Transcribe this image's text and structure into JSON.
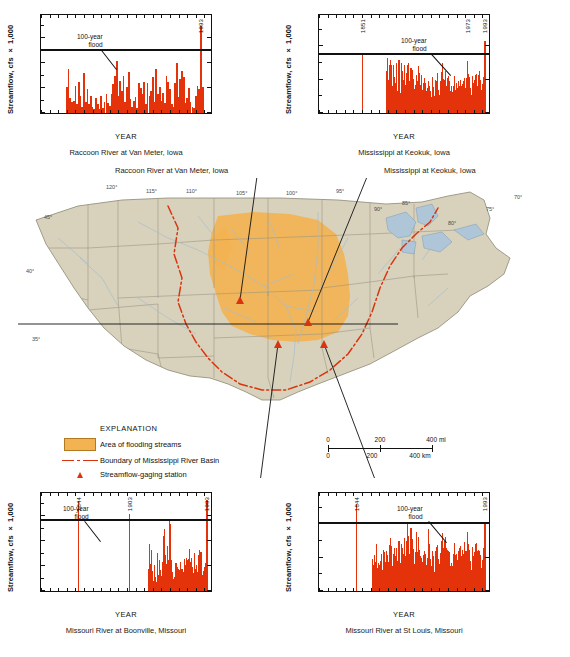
{
  "figure": {
    "red": "#e4320b",
    "flood_orange": "#f3b352",
    "boundary_red": "#d8350f"
  },
  "explanation": {
    "title": "EXPLANATION",
    "items": [
      {
        "key": "area-swatch",
        "label": "Area of flooding streams"
      },
      {
        "key": "boundary-line",
        "label": "Boundary of Mississippi River Basin"
      },
      {
        "key": "station-triangle",
        "label": "Streamflow-gaging station"
      }
    ]
  },
  "scalebar": {
    "miles": [
      "0",
      "200",
      "400 mi"
    ],
    "km": [
      "0",
      "200",
      "400 km"
    ]
  },
  "map": {
    "callouts": [
      {
        "name": "callout-raccoon",
        "text": "Raccoon River at Van Meter, Iowa"
      },
      {
        "name": "callout-keokuk",
        "text": "Mississippi at Keokuk, Iowa"
      }
    ],
    "graticule_labels": [
      "120°",
      "115°",
      "110°",
      "105°",
      "100°",
      "95°",
      "90°",
      "85°",
      "80°",
      "75°",
      "70°",
      "45°",
      "40°",
      "35°"
    ]
  },
  "chart_data": [
    {
      "id": "raccoon",
      "type": "bar",
      "title": "Raccoon River at Van Meter, Iowa",
      "xlabel": "YEAR",
      "ylabel": "Streamflow, cfs × 1,000",
      "xlim": [
        1900,
        2000
      ],
      "ylim": [
        0,
        80
      ],
      "yticks": [
        0,
        20,
        40,
        60,
        80
      ],
      "ytick_labels": [
        "0",
        "20",
        "40",
        "60",
        "80"
      ],
      "xticks": [
        1900,
        1950,
        2000
      ],
      "xtick_labels": [
        "1900",
        "1950",
        "2000"
      ],
      "flood_level": 50,
      "flood_label": "100-year\nflood",
      "annotations": [
        {
          "year": 1993,
          "label": "1993"
        }
      ],
      "x": [
        1915,
        1916,
        1917,
        1918,
        1919,
        1920,
        1921,
        1922,
        1923,
        1924,
        1925,
        1926,
        1927,
        1928,
        1929,
        1930,
        1931,
        1932,
        1933,
        1934,
        1935,
        1936,
        1937,
        1938,
        1939,
        1940,
        1941,
        1942,
        1943,
        1944,
        1945,
        1946,
        1947,
        1948,
        1949,
        1950,
        1951,
        1952,
        1953,
        1954,
        1955,
        1956,
        1957,
        1958,
        1959,
        1960,
        1961,
        1962,
        1963,
        1964,
        1965,
        1966,
        1967,
        1968,
        1969,
        1970,
        1971,
        1972,
        1973,
        1974,
        1975,
        1976,
        1977,
        1978,
        1979,
        1980,
        1981,
        1982,
        1983,
        1984,
        1985,
        1986,
        1987,
        1988,
        1989,
        1990,
        1991,
        1992,
        1993,
        1994
      ],
      "values": [
        21,
        35,
        12,
        9,
        10,
        22,
        7,
        25,
        14,
        5,
        32,
        9,
        19,
        7,
        14,
        5,
        3,
        12,
        7,
        3,
        14,
        4,
        9,
        15,
        8,
        6,
        15,
        23,
        30,
        42,
        14,
        26,
        18,
        30,
        9,
        21,
        33,
        11,
        5,
        10,
        13,
        4,
        24,
        20,
        15,
        25,
        7,
        24,
        14,
        18,
        29,
        9,
        35,
        15,
        21,
        10,
        16,
        8,
        30,
        25,
        19,
        7,
        5,
        24,
        40,
        13,
        27,
        34,
        29,
        8,
        12,
        20,
        9,
        5,
        4,
        14,
        22,
        19,
        70,
        21
      ]
    },
    {
      "id": "keokuk",
      "type": "bar",
      "title": "Mississippi at Keokuk, Iowa",
      "xlabel": "YEAR",
      "ylabel": "Streamflow, cfs × 1,000",
      "xlim": [
        1800,
        2000
      ],
      "ylim": [
        0,
        600
      ],
      "yticks": [
        0,
        200,
        400,
        600
      ],
      "ytick_labels": [
        "0",
        "200",
        "400",
        "600"
      ],
      "xticks": [
        1800,
        1900,
        2000
      ],
      "xtick_labels": [
        "1800",
        "1900",
        "2000"
      ],
      "flood_level": 350,
      "flood_label": "100-year\nflood",
      "annotations": [
        {
          "year": 1851,
          "label": "1851",
          "value": 360
        },
        {
          "year": 1973,
          "label": "1973"
        },
        {
          "year": 1993,
          "label": "1993"
        }
      ],
      "x": [
        1851,
        1878,
        1879,
        1880,
        1881,
        1882,
        1883,
        1884,
        1885,
        1886,
        1887,
        1888,
        1889,
        1890,
        1891,
        1892,
        1893,
        1894,
        1895,
        1896,
        1897,
        1898,
        1899,
        1900,
        1901,
        1902,
        1903,
        1904,
        1905,
        1906,
        1907,
        1908,
        1909,
        1910,
        1911,
        1912,
        1913,
        1914,
        1915,
        1916,
        1917,
        1918,
        1919,
        1920,
        1921,
        1922,
        1923,
        1924,
        1925,
        1926,
        1927,
        1928,
        1929,
        1930,
        1931,
        1932,
        1933,
        1934,
        1935,
        1936,
        1937,
        1938,
        1939,
        1940,
        1941,
        1942,
        1943,
        1944,
        1945,
        1946,
        1947,
        1948,
        1949,
        1950,
        1951,
        1952,
        1953,
        1954,
        1955,
        1956,
        1957,
        1958,
        1959,
        1960,
        1961,
        1962,
        1963,
        1964,
        1965,
        1966,
        1967,
        1968,
        1969,
        1970,
        1971,
        1972,
        1973,
        1974,
        1975,
        1976,
        1977,
        1978,
        1979,
        1980,
        1981,
        1982,
        1983,
        1984,
        1985,
        1986,
        1987,
        1988,
        1989,
        1990,
        1991,
        1992,
        1993,
        1994
      ],
      "values": [
        360,
        150,
        250,
        330,
        200,
        290,
        320,
        290,
        160,
        130,
        290,
        215,
        180,
        300,
        130,
        260,
        320,
        150,
        120,
        300,
        250,
        200,
        290,
        150,
        170,
        240,
        290,
        300,
        190,
        160,
        270,
        160,
        260,
        205,
        145,
        170,
        230,
        140,
        190,
        280,
        240,
        170,
        230,
        140,
        165,
        180,
        210,
        180,
        130,
        150,
        195,
        160,
        145,
        130,
        95,
        215,
        155,
        105,
        200,
        110,
        190,
        240,
        140,
        110,
        190,
        245,
        225,
        300,
        205,
        200,
        250,
        165,
        185,
        210,
        225,
        195,
        130,
        160,
        125,
        130,
        165,
        225,
        140,
        180,
        150,
        190,
        165,
        155,
        200,
        160,
        175,
        190,
        210,
        150,
        165,
        210,
        315,
        235,
        215,
        150,
        110,
        175,
        225,
        180,
        200,
        230,
        235,
        160,
        230,
        225,
        255,
        200,
        140,
        175,
        215,
        260,
        435,
        170
      ]
    },
    {
      "id": "boonville",
      "type": "bar",
      "title": "Missouri River at Boonville, Missouri",
      "xlabel": "YEAR",
      "ylabel": "Streamflow, cfs × 1,000",
      "xlim": [
        1800,
        2000
      ],
      "ylim": [
        0,
        800
      ],
      "yticks": [
        0,
        200,
        400,
        600,
        800
      ],
      "ytick_labels": [
        "0",
        "200",
        "400",
        "600",
        "800"
      ],
      "xticks": [
        1800,
        1900,
        2000
      ],
      "xtick_labels": [
        "1800",
        "1900",
        "2000"
      ],
      "flood_level": 560,
      "flood_label": "100-year\nflood",
      "annotations": [
        {
          "year": 1844,
          "label": "1844",
          "value": 720
        },
        {
          "year": 1903,
          "label": "1903",
          "value": 620
        },
        {
          "year": 1993,
          "label": "1993",
          "value": 725
        }
      ],
      "x": [
        1844,
        1903,
        1925,
        1926,
        1927,
        1928,
        1929,
        1930,
        1931,
        1932,
        1933,
        1934,
        1935,
        1936,
        1937,
        1938,
        1939,
        1940,
        1941,
        1942,
        1943,
        1944,
        1945,
        1946,
        1947,
        1948,
        1949,
        1950,
        1951,
        1952,
        1953,
        1954,
        1955,
        1956,
        1957,
        1958,
        1959,
        1960,
        1961,
        1962,
        1963,
        1964,
        1965,
        1966,
        1967,
        1968,
        1969,
        1970,
        1971,
        1972,
        1973,
        1974,
        1975,
        1976,
        1977,
        1978,
        1979,
        1980,
        1981,
        1982,
        1983,
        1984,
        1985,
        1986,
        1987,
        1988,
        1989,
        1990,
        1991,
        1992,
        1993
      ],
      "values": [
        720,
        620,
        180,
        375,
        220,
        200,
        330,
        160,
        80,
        210,
        110,
        70,
        305,
        105,
        125,
        245,
        170,
        120,
        230,
        345,
        440,
        500,
        285,
        215,
        360,
        250,
        565,
        290,
        535,
        250,
        150,
        100,
        110,
        90,
        225,
        210,
        195,
        175,
        165,
        230,
        175,
        165,
        180,
        150,
        255,
        205,
        265,
        245,
        225,
        260,
        340,
        235,
        265,
        190,
        145,
        235,
        305,
        175,
        205,
        155,
        290,
        330,
        300,
        310,
        250,
        130,
        160,
        195,
        225,
        275,
        725
      ]
    },
    {
      "id": "stlouis",
      "type": "bar",
      "title": "Missouri River at St Louis, Missouri",
      "xlabel": "YEAR",
      "ylabel": "Streamflow, cfs × 1,000",
      "xlim": [
        1800,
        2000
      ],
      "ylim": [
        0,
        1500
      ],
      "yticks": [
        0,
        500,
        1000,
        1500
      ],
      "ytick_labels": [
        "0",
        "500",
        "1,000",
        "1,500"
      ],
      "xticks": [
        1800,
        1900,
        2000
      ],
      "xtick_labels": [
        "1800",
        "1900",
        "2000"
      ],
      "flood_level": 1000,
      "flood_label": "100-year\nflood",
      "annotations": [
        {
          "year": 1844,
          "label": "1844",
          "value": 1310
        },
        {
          "year": 1993,
          "label": "1993",
          "value": 1030
        }
      ],
      "x": [
        1844,
        1862,
        1863,
        1864,
        1865,
        1866,
        1867,
        1868,
        1869,
        1870,
        1871,
        1872,
        1873,
        1874,
        1875,
        1876,
        1877,
        1878,
        1879,
        1880,
        1881,
        1882,
        1883,
        1884,
        1885,
        1886,
        1887,
        1888,
        1889,
        1890,
        1891,
        1892,
        1893,
        1894,
        1895,
        1896,
        1897,
        1898,
        1899,
        1900,
        1901,
        1902,
        1903,
        1904,
        1905,
        1906,
        1907,
        1908,
        1909,
        1910,
        1911,
        1912,
        1913,
        1914,
        1915,
        1916,
        1917,
        1918,
        1919,
        1920,
        1921,
        1922,
        1923,
        1924,
        1925,
        1926,
        1927,
        1928,
        1929,
        1930,
        1931,
        1932,
        1933,
        1934,
        1935,
        1936,
        1937,
        1938,
        1939,
        1940,
        1941,
        1942,
        1943,
        1944,
        1945,
        1946,
        1947,
        1948,
        1949,
        1950,
        1951,
        1952,
        1953,
        1954,
        1955,
        1956,
        1957,
        1958,
        1959,
        1960,
        1961,
        1962,
        1963,
        1964,
        1965,
        1966,
        1967,
        1968,
        1969,
        1970,
        1971,
        1972,
        1973,
        1974,
        1975,
        1976,
        1977,
        1978,
        1979,
        1980,
        1981,
        1982,
        1983,
        1984,
        1985,
        1986,
        1987,
        1988,
        1989,
        1990,
        1991,
        1992,
        1993,
        1994
      ],
      "values": [
        1310,
        480,
        395,
        310,
        540,
        430,
        705,
        340,
        420,
        390,
        300,
        450,
        560,
        320,
        610,
        590,
        440,
        400,
        600,
        540,
        430,
        690,
        800,
        670,
        380,
        355,
        560,
        640,
        520,
        640,
        450,
        600,
        750,
        380,
        420,
        700,
        640,
        560,
        790,
        460,
        520,
        750,
        1000,
        830,
        560,
        620,
        940,
        560,
        780,
        630,
        400,
        580,
        880,
        420,
        590,
        810,
        620,
        530,
        500,
        440,
        380,
        540,
        600,
        560,
        390,
        490,
        930,
        700,
        520,
        480,
        380,
        600,
        520,
        290,
        600,
        330,
        660,
        690,
        480,
        400,
        570,
        740,
        750,
        870,
        640,
        750,
        810,
        640,
        620,
        600,
        590,
        580,
        380,
        420,
        380,
        370,
        560,
        720,
        540,
        560,
        470,
        600,
        520,
        650,
        680,
        530,
        620,
        560,
        740,
        600,
        520,
        600,
        880,
        700,
        620,
        450,
        320,
        560,
        660,
        520,
        580,
        700,
        720,
        600,
        620,
        540,
        600,
        540,
        350,
        470,
        640,
        600,
        1030,
        590
      ]
    }
  ]
}
